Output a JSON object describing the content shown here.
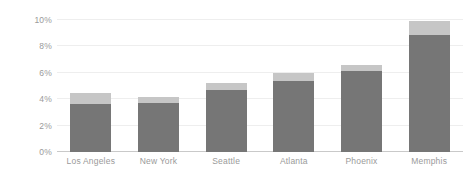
{
  "chart_data": {
    "type": "bar",
    "subtype": "stacked-bar",
    "title": "",
    "subtitle": "",
    "xlabel": "",
    "ylabel": "",
    "categories": [
      "Los Angeles",
      "New York",
      "Seattle",
      "Atlanta",
      "Phoenix",
      "Memphis"
    ],
    "ylim": [
      0,
      10
    ],
    "ytick_values": [
      0,
      2,
      4,
      6,
      8,
      10
    ],
    "ytick_labels": [
      "0%",
      "2%",
      "4%",
      "6%",
      "8%",
      "10%"
    ],
    "y_unit": "%",
    "grid": true,
    "grid_axis": "y",
    "legend": false,
    "legend_position": "none",
    "series": [
      {
        "name": "base",
        "color": "#767676",
        "values": [
          3.6,
          3.7,
          4.7,
          5.4,
          6.1,
          8.9
        ]
      },
      {
        "name": "top",
        "color": "#c6c6c6",
        "values": [
          0.9,
          0.5,
          0.5,
          0.6,
          0.5,
          1.0
        ]
      }
    ],
    "totals": [
      4.5,
      4.2,
      5.2,
      6.0,
      6.6,
      9.9
    ],
    "annotations": []
  },
  "style": {
    "background": "#ffffff",
    "grid_color": "#eeeeee",
    "axis_color": "#c9c9c9",
    "tick_text_color": "#9a9a9a"
  }
}
